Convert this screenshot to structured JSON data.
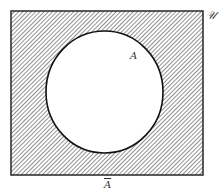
{
  "diagram": {
    "type": "venn",
    "title": "",
    "universe": {
      "label": "𝒰",
      "label_text": "U",
      "shaded": true,
      "hatch_color": "#555555"
    },
    "set_a": {
      "label": "A",
      "shaded": false,
      "fill": "#ffffff",
      "stroke": "#111111"
    },
    "complement": {
      "label": "A",
      "description": "A-bar (complement of A), the shaded region outside the circle"
    }
  }
}
